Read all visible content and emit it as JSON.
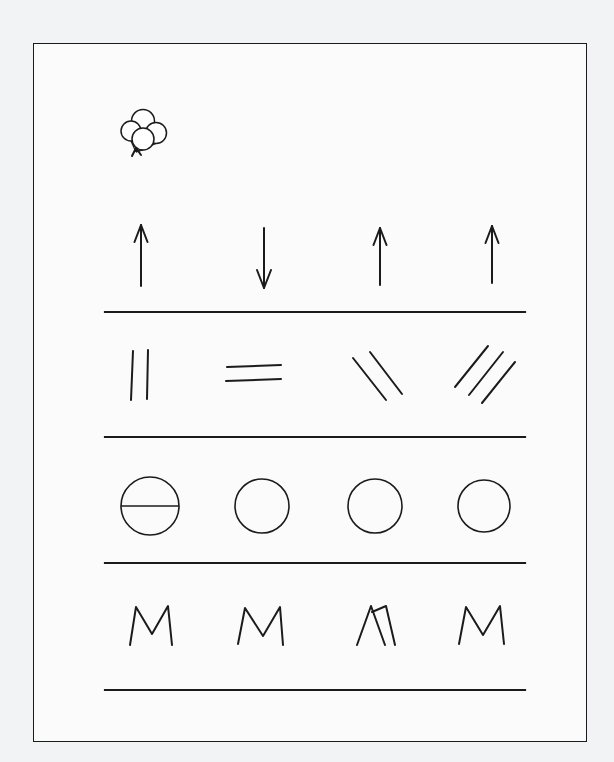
{
  "page": {
    "background_color": "#f2f3f5",
    "paper_color": "#fbfbfc",
    "ink_color": "#1b1b1b",
    "width": 614,
    "height": 762
  },
  "frame": {
    "name": "paper-frame",
    "x": 33,
    "y": 43,
    "width": 554,
    "height": 699,
    "stroke_color": "#1b1b1b",
    "stroke_width": 1.4
  },
  "decoration": {
    "name": "balloon-cluster",
    "label": "balloons",
    "center_x": 148,
    "center_y": 128,
    "balloon_count": 4,
    "balloons": [
      {
        "cx": 143,
        "cy": 121,
        "r": 11.5
      },
      {
        "cx": 131,
        "cy": 131,
        "r": 10.0
      },
      {
        "cx": 156,
        "cy": 133,
        "r": 10.5
      },
      {
        "cx": 143,
        "cy": 139,
        "r": 11.0
      }
    ],
    "string_anchor": {
      "x": 136,
      "y": 152
    }
  },
  "rules": {
    "name": "ruled-lines",
    "x_start": 105,
    "x_end": 525,
    "stroke_width": 2.2,
    "y_positions": [
      312,
      437,
      563,
      690
    ]
  },
  "columns": {
    "centers": [
      150,
      262,
      375,
      483
    ],
    "count": 4
  },
  "rows": [
    {
      "index": 1,
      "name": "arrow-row",
      "label": "arrows",
      "baseline_y": 312,
      "items": [
        {
          "name": "arrow-up-1",
          "glyph": "arrow",
          "direction": "up",
          "cx": 141,
          "top_y": 225,
          "bottom_y": 286,
          "head_width": 13,
          "head_height": 17
        },
        {
          "name": "arrow-down-1",
          "glyph": "arrow",
          "direction": "down",
          "cx": 264,
          "top_y": 228,
          "bottom_y": 288,
          "head_width": 14,
          "head_height": 18
        },
        {
          "name": "arrow-up-2",
          "glyph": "arrow",
          "direction": "up",
          "cx": 380,
          "top_y": 228,
          "bottom_y": 285,
          "head_width": 13,
          "head_height": 17
        },
        {
          "name": "arrow-up-3",
          "glyph": "arrow",
          "direction": "up",
          "cx": 492,
          "top_y": 226,
          "bottom_y": 283,
          "head_width": 13,
          "head_height": 17
        }
      ]
    },
    {
      "index": 2,
      "name": "stroke-row",
      "label": "strokes",
      "baseline_y": 437,
      "items": [
        {
          "name": "vertical-strokes",
          "glyph": "lines",
          "orientation": "vertical",
          "count": 2,
          "strokes": [
            {
              "x1": 133,
              "y1": 351,
              "x2": 131,
              "y2": 400
            },
            {
              "x1": 148,
              "y1": 350,
              "x2": 147,
              "y2": 399
            }
          ]
        },
        {
          "name": "horizontal-strokes",
          "glyph": "lines",
          "orientation": "horizontal",
          "count": 2,
          "strokes": [
            {
              "x1": 227,
              "y1": 367,
              "x2": 281,
              "y2": 365
            },
            {
              "x1": 226,
              "y1": 381,
              "x2": 281,
              "y2": 379
            }
          ]
        },
        {
          "name": "backslash-strokes",
          "glyph": "lines",
          "orientation": "backslash",
          "count": 2,
          "strokes": [
            {
              "x1": 353,
              "y1": 358,
              "x2": 386,
              "y2": 400
            },
            {
              "x1": 370,
              "y1": 352,
              "x2": 402,
              "y2": 394
            }
          ]
        },
        {
          "name": "forwardslash-strokes",
          "glyph": "lines",
          "orientation": "forwardslash",
          "count": 3,
          "strokes": [
            {
              "x1": 455,
              "y1": 387,
              "x2": 488,
              "y2": 346
            },
            {
              "x1": 469,
              "y1": 395,
              "x2": 503,
              "y2": 352
            },
            {
              "x1": 482,
              "y1": 403,
              "x2": 515,
              "y2": 362
            }
          ]
        }
      ]
    },
    {
      "index": 3,
      "name": "circle-row",
      "label": "circles",
      "baseline_y": 563,
      "items": [
        {
          "name": "circle-with-diameter",
          "glyph": "circle",
          "cx": 150,
          "cy": 506,
          "r": 29,
          "has_diameter_line": true,
          "diameter_y": 506
        },
        {
          "name": "circle-plain-1",
          "glyph": "circle",
          "cx": 262,
          "cy": 506,
          "r": 27,
          "has_diameter_line": false
        },
        {
          "name": "circle-plain-2",
          "glyph": "circle",
          "cx": 375,
          "cy": 506,
          "r": 27,
          "has_diameter_line": false
        },
        {
          "name": "circle-plain-3",
          "glyph": "circle",
          "cx": 484,
          "cy": 506,
          "r": 26,
          "has_diameter_line": false
        }
      ]
    },
    {
      "index": 4,
      "name": "letter-row",
      "label": "letter M",
      "baseline_y": 690,
      "items": [
        {
          "name": "letter-m-1",
          "glyph": "letter",
          "character": "M",
          "style": "normal",
          "points": "130,645 136,607 152,634 168,606 172,645"
        },
        {
          "name": "letter-m-2",
          "glyph": "letter",
          "character": "M",
          "style": "normal",
          "points": "238,644 245,608 263,636 280,607 283,645"
        },
        {
          "name": "letter-m-3",
          "glyph": "letter",
          "character": "M",
          "style": "crossed",
          "points": "357,645 371,606 385,645 372,612 386,606 395,645"
        },
        {
          "name": "letter-m-4",
          "glyph": "letter",
          "character": "M",
          "style": "normal",
          "points": "459,644 466,607 483,635 500,606 504,644"
        }
      ]
    }
  ]
}
